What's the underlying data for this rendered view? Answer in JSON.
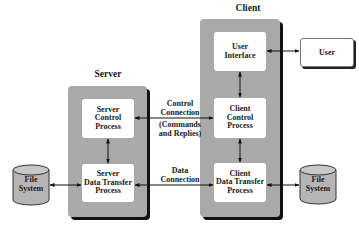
{
  "diagram": {
    "server": {
      "title": "Server",
      "control_process": [
        "Server",
        "Control",
        "Process"
      ],
      "data_transfer_process": [
        "Server",
        "Data Transfer",
        "Process"
      ]
    },
    "client": {
      "title": "Client",
      "user_interface": [
        "User",
        "Interface"
      ],
      "control_process": [
        "Client",
        "Control",
        "Process"
      ],
      "data_transfer_process": [
        "Client",
        "Data Transfer",
        "Process"
      ]
    },
    "user": {
      "label": "User"
    },
    "file_system_left": [
      "File",
      "System"
    ],
    "file_system_right": [
      "File",
      "System"
    ],
    "connections": {
      "control": [
        "Control",
        "Connection"
      ],
      "control_note": [
        "(Commands",
        "and Replies)"
      ],
      "data": [
        "Data",
        "Connection"
      ]
    },
    "colors": {
      "container_fill": "#a9a9a9",
      "container_shadow": "#111111",
      "box_fill": "#ffffff",
      "cylinder_fill": "#b5b5b5"
    }
  }
}
